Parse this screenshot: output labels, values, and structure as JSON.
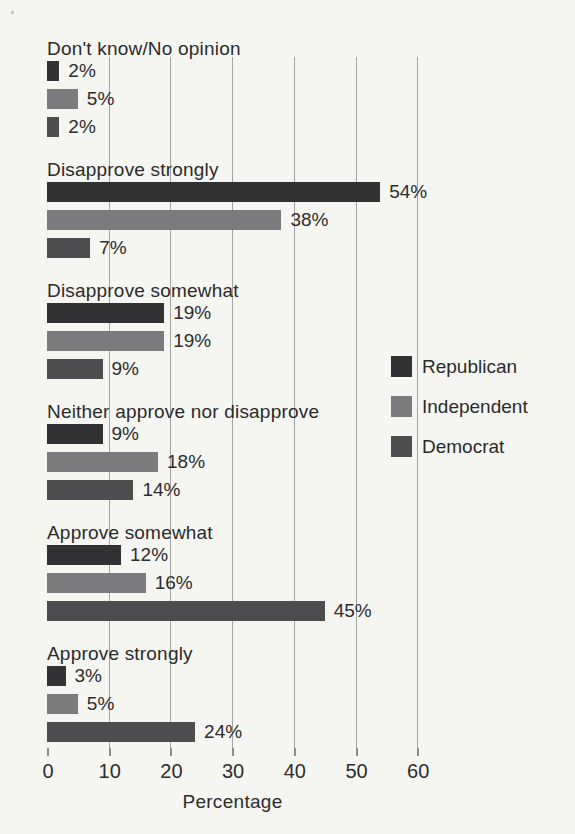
{
  "chart_data": {
    "type": "bar",
    "orientation": "horizontal",
    "title": "",
    "xlabel": "Percentage",
    "x_ticks": [
      0,
      10,
      20,
      30,
      40,
      50,
      60
    ],
    "xlim": [
      0,
      64
    ],
    "grid": "vertical",
    "value_suffix": "%",
    "categories": [
      "Don't know/No opinion",
      "Disapprove strongly",
      "Disapprove somewhat",
      "Neither approve nor disapprove",
      "Approve somewhat",
      "Approve strongly"
    ],
    "series": [
      {
        "name": "Republican",
        "color": "#323235",
        "values": [
          2,
          54,
          19,
          9,
          12,
          3
        ]
      },
      {
        "name": "Independent",
        "color": "#7b7b7d",
        "values": [
          5,
          38,
          19,
          18,
          16,
          5
        ]
      },
      {
        "name": "Democrat",
        "color": "#4d4d4f",
        "values": [
          2,
          7,
          9,
          14,
          45,
          24
        ]
      }
    ],
    "legend": {
      "position": "right-middle",
      "entries": [
        "Republican",
        "Independent",
        "Democrat"
      ]
    }
  },
  "style_colors": {
    "background": "#f5f5f2",
    "gridline": "#a3a3a1",
    "text": "#2d2d2d"
  }
}
